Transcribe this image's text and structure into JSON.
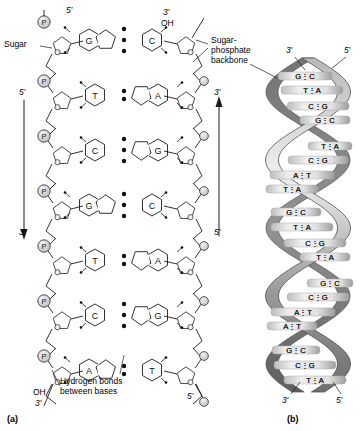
{
  "figure": {
    "panel_a_tag": "(a)",
    "panel_b_tag": "(b)"
  },
  "callouts": {
    "sugar": "Sugar",
    "sugar_phosphate_backbone": "Sugar-\nphosphate\nbackbone",
    "hydrogen_bonds": "Hydrogen bonds\nbetween bases"
  },
  "panel_a": {
    "end_labels": {
      "top_left_prime": "5′",
      "top_right_prime": "3′",
      "top_right_oh": "OH",
      "bottom_left_oh": "OH",
      "bottom_left_prime": "3′",
      "bottom_right_prime": "5′"
    },
    "left_arrow": {
      "start_label": "5′",
      "end_label": "3′",
      "direction": "down"
    },
    "right_arrow": {
      "start_label": "5′",
      "end_label": "3′",
      "direction": "up"
    },
    "phosphate_symbol": "P",
    "rows": [
      {
        "left_base": "G",
        "right_base": "C",
        "hbonds": 3,
        "left_type": "purine",
        "right_type": "pyrimidine"
      },
      {
        "left_base": "T",
        "right_base": "A",
        "hbonds": 2,
        "left_type": "pyrimidine",
        "right_type": "purine"
      },
      {
        "left_base": "C",
        "right_base": "G",
        "hbonds": 3,
        "left_type": "pyrimidine",
        "right_type": "purine"
      },
      {
        "left_base": "G",
        "right_base": "C",
        "hbonds": 3,
        "left_type": "purine",
        "right_type": "pyrimidine"
      },
      {
        "left_base": "T",
        "right_base": "A",
        "hbonds": 2,
        "left_type": "pyrimidine",
        "right_type": "purine"
      },
      {
        "left_base": "C",
        "right_base": "G",
        "hbonds": 3,
        "left_type": "pyrimidine",
        "right_type": "purine"
      },
      {
        "left_base": "A",
        "right_base": "T",
        "hbonds": 2,
        "left_type": "purine",
        "right_type": "pyrimidine"
      }
    ]
  },
  "panel_b": {
    "top_left_prime": "3′",
    "top_right_prime": "5′",
    "bottom_left_prime": "3′",
    "bottom_right_prime": "5′",
    "rungs": [
      {
        "label": "G⋮C",
        "y": 76,
        "x": 305,
        "w": 54
      },
      {
        "label": "T⋮A",
        "y": 90,
        "x": 312,
        "w": 62
      },
      {
        "label": "C⋮G",
        "y": 106,
        "x": 318,
        "w": 62
      },
      {
        "label": "G⋮C",
        "y": 120,
        "x": 325,
        "w": 50
      },
      {
        "label": "T⋮A",
        "y": 146,
        "x": 330,
        "w": 44
      },
      {
        "label": "C⋮G",
        "y": 160,
        "x": 318,
        "w": 60
      },
      {
        "label": "A⋮T",
        "y": 175,
        "x": 302,
        "w": 64
      },
      {
        "label": "T⋮A",
        "y": 189,
        "x": 292,
        "w": 52
      },
      {
        "label": "G⋮C",
        "y": 212,
        "x": 296,
        "w": 50
      },
      {
        "label": "T⋮A",
        "y": 227,
        "x": 302,
        "w": 62
      },
      {
        "label": "C⋮G",
        "y": 243,
        "x": 315,
        "w": 62
      },
      {
        "label": "T⋮A",
        "y": 257,
        "x": 325,
        "w": 50
      },
      {
        "label": "G⋮C",
        "y": 283,
        "x": 330,
        "w": 46
      },
      {
        "label": "C⋮G",
        "y": 297,
        "x": 318,
        "w": 62
      },
      {
        "label": "A⋮T",
        "y": 312,
        "x": 303,
        "w": 64
      },
      {
        "label": "A⋮T",
        "y": 326,
        "x": 292,
        "w": 50
      },
      {
        "label": "G⋮C",
        "y": 350,
        "x": 296,
        "w": 48
      },
      {
        "label": "C⋮G",
        "y": 365,
        "x": 305,
        "w": 62
      },
      {
        "label": "T⋮A",
        "y": 380,
        "x": 315,
        "w": 62
      }
    ]
  },
  "colors": {
    "ink": "#1a1a1a",
    "sugar_fill": "#8a8a8a",
    "phosphate_fill": "#d8d8d8",
    "ribbon_dark": "#808080",
    "ribbon_light": "#d9d9d9"
  }
}
